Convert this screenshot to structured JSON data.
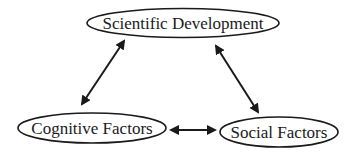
{
  "diagram": {
    "nodes": [
      {
        "id": "scientific",
        "label": "Scientific Development",
        "cx": 183,
        "cy": 23,
        "rx": 96,
        "ry": 14.5,
        "font_size": 17
      },
      {
        "id": "cognitive",
        "label": "Cognitive Factors",
        "cx": 92,
        "cy": 128,
        "rx": 74,
        "ry": 15,
        "font_size": 17
      },
      {
        "id": "social",
        "label": "Social Factors",
        "cx": 279,
        "cy": 132,
        "rx": 59,
        "ry": 15,
        "font_size": 17
      }
    ],
    "edges": [
      {
        "from": "scientific",
        "to": "cognitive",
        "type": "bidirectional",
        "x1": 124,
        "y1": 41,
        "x2": 82,
        "y2": 104
      },
      {
        "from": "scientific",
        "to": "social",
        "type": "bidirectional",
        "x1": 216,
        "y1": 46,
        "x2": 258,
        "y2": 112
      },
      {
        "from": "cognitive",
        "to": "social",
        "type": "bidirectional",
        "x1": 171,
        "y1": 130,
        "x2": 215,
        "y2": 130
      }
    ],
    "colors": {
      "stroke": "#1a1a1a",
      "fill": "#ffffff"
    }
  }
}
